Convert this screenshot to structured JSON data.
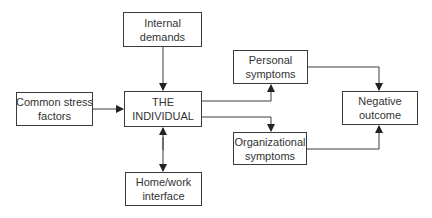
{
  "diagram": {
    "nodes": {
      "internal": {
        "line1": "Internal",
        "line2": "demands"
      },
      "common": {
        "line1": "Common stress",
        "line2": "factors"
      },
      "individual": {
        "line1": "THE",
        "line2": "INDIVIDUAL"
      },
      "homework": {
        "line1": "Home/work",
        "line2": "interface"
      },
      "personal": {
        "line1": "Personal",
        "line2": "symptoms"
      },
      "organizational": {
        "line1": "Organizational",
        "line2": "symptoms"
      },
      "negative": {
        "line1": "Negative",
        "line2": "outcome"
      }
    },
    "edges": [
      {
        "from": "Internal demands",
        "to": "THE INDIVIDUAL"
      },
      {
        "from": "Common stress factors",
        "to": "THE INDIVIDUAL"
      },
      {
        "from": "THE INDIVIDUAL",
        "to": "Home/work interface",
        "bidirectional": true
      },
      {
        "from": "THE INDIVIDUAL",
        "to": "Personal symptoms"
      },
      {
        "from": "THE INDIVIDUAL",
        "to": "Organizational symptoms"
      },
      {
        "from": "Personal symptoms",
        "to": "Negative outcome"
      },
      {
        "from": "Organizational symptoms",
        "to": "Negative outcome"
      }
    ],
    "line_color": "#3a3a3a"
  }
}
